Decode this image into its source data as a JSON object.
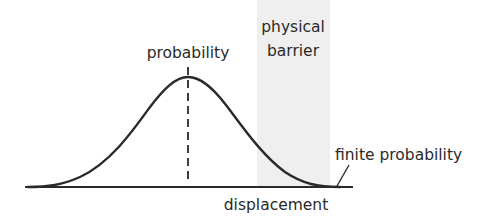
{
  "diagram": {
    "labels": {
      "peak": "probability",
      "barrier_line1": "physical",
      "barrier_line2": "barrier",
      "axis": "displacement",
      "tail": "finite probability"
    },
    "colors": {
      "curve": "#2a2a2a",
      "barrier_fill": "#efefef",
      "text": "#2a2a2a"
    }
  }
}
